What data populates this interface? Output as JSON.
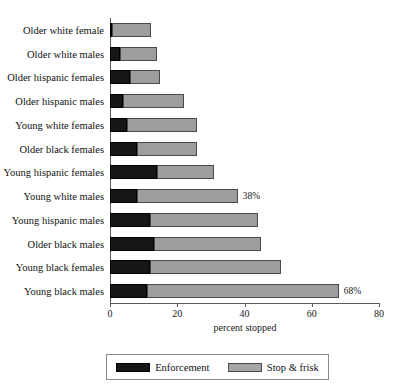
{
  "chart_data": {
    "type": "bar",
    "orientation": "horizontal",
    "stacked": true,
    "title": "",
    "xlabel": "percent stopped",
    "ylabel": "",
    "xlim": [
      0,
      80
    ],
    "xticks": [
      0,
      20,
      40,
      60,
      80
    ],
    "xtick_labels": [
      "0",
      "20",
      "40",
      "60",
      "80"
    ],
    "grid": false,
    "legend_position": "bottom",
    "categories": [
      "Older white female",
      "Older white males",
      "Older hispanic females",
      "Older hispanic males",
      "Young white females",
      "Older black females",
      "Young hispanic females",
      "Young white males",
      "Young hispanic males",
      "Older black males",
      "Young black females",
      "Young black males"
    ],
    "series": [
      {
        "name": "Enforcement",
        "color": "#161616",
        "values": [
          0.5,
          3,
          6,
          4,
          5,
          8,
          14,
          8,
          12,
          13,
          12,
          11
        ]
      },
      {
        "name": "Stop & frisk",
        "color": "#9d9d9d",
        "values": [
          11.5,
          11,
          9,
          18,
          21,
          18,
          17,
          30,
          32,
          32,
          39,
          57
        ]
      }
    ],
    "totals": [
      12,
      14,
      15,
      22,
      26,
      26,
      31,
      38,
      44,
      45,
      51,
      68
    ],
    "data_labels": [
      {
        "category": "Young white males",
        "text": "38%",
        "total": 38
      },
      {
        "category": "Young black males",
        "text": "68%",
        "total": 68
      }
    ]
  },
  "legend": {
    "items": [
      {
        "label": "Enforcement",
        "swatch": "enforcement-swatch"
      },
      {
        "label": "Stop & frisk",
        "swatch": "stop-and-frisk-swatch"
      }
    ]
  },
  "axis": {
    "x_title": "percent stopped"
  }
}
